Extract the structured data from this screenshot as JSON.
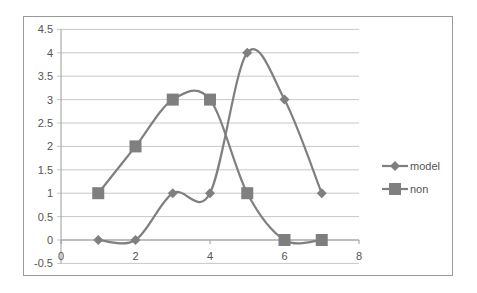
{
  "chart_data": {
    "type": "line",
    "title": "",
    "xlabel": "",
    "ylabel": "",
    "xlim": [
      0,
      8
    ],
    "ylim": [
      -0.5,
      4.5
    ],
    "x_ticks": [
      "0",
      "2",
      "4",
      "6",
      "8"
    ],
    "y_ticks": [
      "4.5",
      "4",
      "3.5",
      "3",
      "2.5",
      "2",
      "1.5",
      "1",
      "0.5",
      "0",
      "-0.5"
    ],
    "grid": true,
    "smooth": true,
    "legend_position": "right",
    "series": [
      {
        "name": "model",
        "marker": "diamond",
        "x": [
          1,
          2,
          3,
          4,
          5,
          6,
          7
        ],
        "values": [
          0,
          0,
          1,
          1,
          4,
          3,
          1
        ]
      },
      {
        "name": "non",
        "marker": "square",
        "x": [
          1,
          2,
          3,
          4,
          5,
          6,
          7
        ],
        "values": [
          1,
          2,
          3,
          3,
          1,
          0,
          0
        ]
      }
    ],
    "colors": {
      "line": "#7f7f7f",
      "grid": "#c8c8c8",
      "axis": "#9a9a9a",
      "text": "#555555"
    }
  }
}
